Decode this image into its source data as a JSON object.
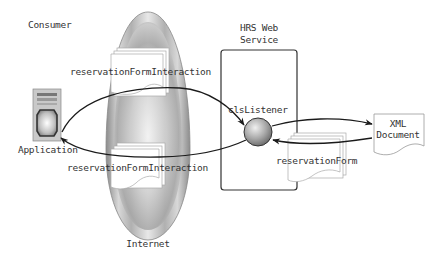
{
  "diagram": {
    "labels": {
      "consumer": "Consumer",
      "application": "Application",
      "internet": "Internet",
      "hrs_line1": "HRS Web",
      "hrs_line2": "Service",
      "listener": "clsListener",
      "xml_line1": "XML",
      "xml_line2": "Document",
      "interaction_top": "reservationFormInteraction",
      "interaction_bottom": "reservationFormInteraction",
      "reservation_form": "reservationForm"
    },
    "nodes": [
      {
        "id": "application",
        "type": "server-icon",
        "label": "Application",
        "group": "Consumer"
      },
      {
        "id": "internet",
        "type": "cloud-oval",
        "label": "Internet"
      },
      {
        "id": "hrs",
        "type": "container-box",
        "label": "HRS Web Service"
      },
      {
        "id": "listener",
        "type": "sphere",
        "label": "clsListener"
      },
      {
        "id": "xml",
        "type": "document",
        "label": "XML Document"
      }
    ],
    "edges": [
      {
        "from": "application",
        "to": "listener",
        "label": "reservationFormInteraction"
      },
      {
        "from": "listener",
        "to": "application",
        "label": "reservationFormInteraction"
      },
      {
        "from": "listener",
        "to": "xml",
        "label": ""
      },
      {
        "from": "xml",
        "to": "listener",
        "label": "reservationForm"
      }
    ],
    "colors": {
      "line": "#1a1a1a",
      "box_border": "#333333",
      "doc_border": "#999999",
      "oval_mid": "#b8b8b8",
      "sphere": "#9a9a9a"
    }
  }
}
